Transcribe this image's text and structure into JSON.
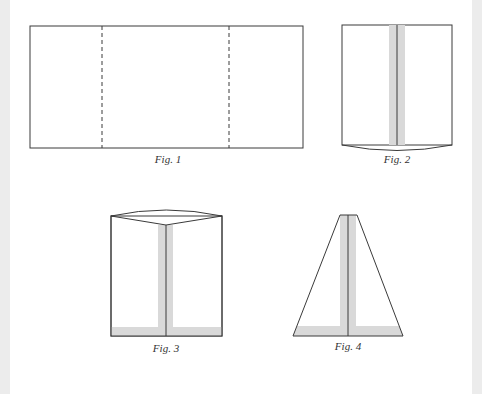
{
  "figures": [
    {
      "id": "fig1",
      "caption": "Fig. 1",
      "description": "Flat rectangle with two dashed fold lines"
    },
    {
      "id": "fig2",
      "caption": "Fig. 2",
      "description": "Folded rectangle with center seam and curved bottom"
    },
    {
      "id": "fig3",
      "caption": "Fig. 3",
      "description": "Rectangle with curved top flap, seam and shaded hem"
    },
    {
      "id": "fig4",
      "caption": "Fig. 4",
      "description": "Trapezoid with center seam and shaded hem"
    }
  ],
  "colors": {
    "line": "#3a3a3a",
    "shade": "#d9d9d9",
    "margin": "#ececec",
    "background": "#ffffff"
  }
}
